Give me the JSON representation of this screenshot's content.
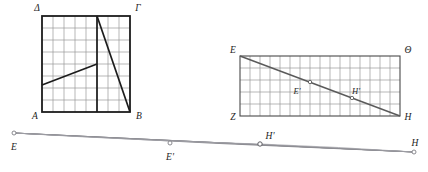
{
  "figure": {
    "background_color": "#ffffff",
    "stroke_color": "#1c1c1c",
    "grid_color": "#9a9a9a",
    "thin_line_color": "#8d8d93"
  },
  "square": {
    "name": "square-ABGD",
    "vertices": {
      "top_left": "Δ",
      "top_right": "Γ",
      "bottom_left": "A",
      "bottom_right": "B"
    },
    "grid_cols": 8,
    "grid_rows": 8,
    "x": 42,
    "y": 16,
    "width": 88,
    "height": 96,
    "lines": [
      {
        "name": "vertical-transversal",
        "from": [
          0.625,
          0.0
        ],
        "to": [
          0.625,
          1.0
        ]
      },
      {
        "name": "shallow-transversal",
        "from": [
          0.0,
          0.72
        ],
        "to": [
          0.625,
          0.5
        ]
      },
      {
        "name": "steep-diagonal",
        "from": [
          0.625,
          0.0
        ],
        "to": [
          1.0,
          1.0
        ]
      }
    ]
  },
  "rectangle": {
    "name": "rectangle-EZHTheta",
    "vertices": {
      "top_left": "E",
      "top_right": "Θ",
      "bottom_left": "Z",
      "bottom_right": "H"
    },
    "grid_cols": 16,
    "grid_rows": 5,
    "x": 240,
    "y": 56,
    "width": 160,
    "height": 60,
    "diagonal": {
      "name": "diagonal-E-to-H",
      "from": [
        0.0,
        0.0
      ],
      "to": [
        1.0,
        1.0
      ]
    },
    "marked_points": [
      {
        "label": "E'",
        "t": 0.44,
        "label_dx": -8,
        "label_dy": 11
      },
      {
        "label": "H'",
        "t": 0.7,
        "label_dx": 3,
        "label_dy": -4
      }
    ]
  },
  "lens": {
    "name": "degenerate-lens-EH",
    "endpoints": [
      {
        "label": "E",
        "x": 14,
        "y": 133,
        "label_dx": -4,
        "label_dy": 14
      },
      {
        "label": "E'",
        "x": 170,
        "y": 143,
        "label_dx": -4,
        "label_dy": 14
      },
      {
        "label": "H'",
        "x": 260,
        "y": 144,
        "label_dx": 6,
        "label_dy": -5
      },
      {
        "label": "H",
        "x": 414,
        "y": 152,
        "label_dx": -1,
        "label_dy": -7
      }
    ],
    "bulge_point": {
      "x": 262,
      "y": 140
    }
  }
}
